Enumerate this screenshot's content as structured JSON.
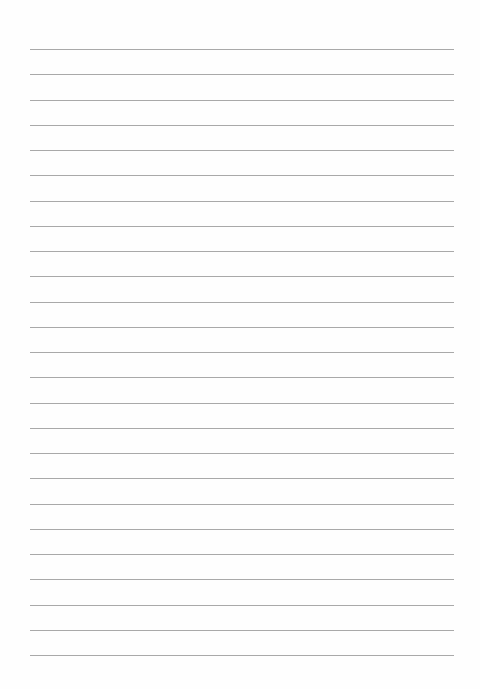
{
  "page": {
    "type": "lined-paper",
    "line_count": 25,
    "first_line_y": 49,
    "line_spacing": 25.25,
    "line_color": "#a9a9a9",
    "background": "#fefefe"
  }
}
